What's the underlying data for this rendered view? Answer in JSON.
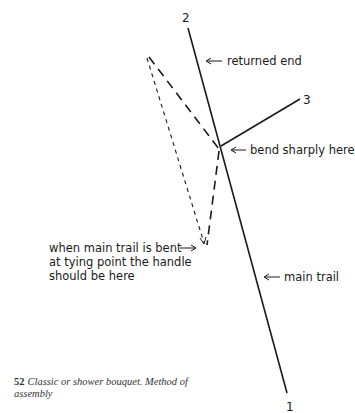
{
  "diagram": {
    "numbers": {
      "one": "1",
      "two": "2",
      "three": "3"
    },
    "labels": {
      "returned_end": "returned end",
      "bend_sharply": "bend sharply here",
      "main_trail": "main trail",
      "handle_line1": "when main trail is bent",
      "handle_line2": "at tying point the handle",
      "handle_line3": "should be here"
    },
    "arrow_glyph": "←",
    "colors": {
      "line": "#1a1a1a",
      "background": "#ffffff"
    }
  },
  "caption": {
    "figure_number": "52",
    "text": "Classic or shower bouquet. Method of assembly"
  }
}
